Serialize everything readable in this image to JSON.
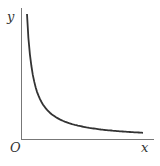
{
  "chart_data": {
    "type": "line",
    "title": "",
    "xlabel": "x",
    "ylabel": "y",
    "origin_label": "O",
    "grid": false,
    "legend": null,
    "series": [
      {
        "name": "y = k/x (hyperbola branch)",
        "x": [
          0.05,
          0.08,
          0.12,
          0.2,
          0.3,
          0.45,
          0.6,
          0.8,
          1.0
        ],
        "y": [
          1.0,
          0.62,
          0.42,
          0.25,
          0.17,
          0.11,
          0.083,
          0.062,
          0.05
        ]
      }
    ],
    "xlim": [
      0,
      1
    ],
    "ylim": [
      0,
      1
    ]
  },
  "labels": {
    "x_axis": "x",
    "y_axis": "y",
    "origin": "O"
  }
}
